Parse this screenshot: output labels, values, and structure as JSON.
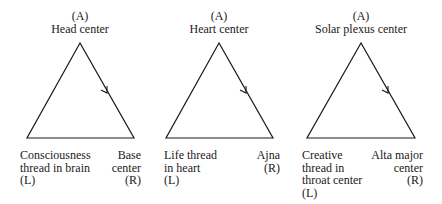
{
  "triangles": [
    {
      "apex": {
        "tag": "(A)",
        "label": "Head center"
      },
      "left": {
        "lines": [
          "Consciousness",
          "thread in brain",
          "(L)"
        ]
      },
      "right": {
        "lines": [
          "Base",
          "center",
          "(R)"
        ]
      }
    },
    {
      "apex": {
        "tag": "(A)",
        "label": "Heart center"
      },
      "left": {
        "lines": [
          "Life thread",
          "in heart",
          "(L)"
        ]
      },
      "right": {
        "lines": [
          "Ajna",
          "(R)"
        ]
      }
    },
    {
      "apex": {
        "tag": "(A)",
        "label": "Solar plexus center"
      },
      "left": {
        "lines": [
          "Creative",
          "thread in",
          "throat center",
          "(L)"
        ]
      },
      "right": {
        "lines": [
          "Alta major",
          "center",
          "(R)"
        ]
      }
    }
  ],
  "colors": {
    "stroke": "#1a1a1a",
    "background": "#ffffff"
  }
}
